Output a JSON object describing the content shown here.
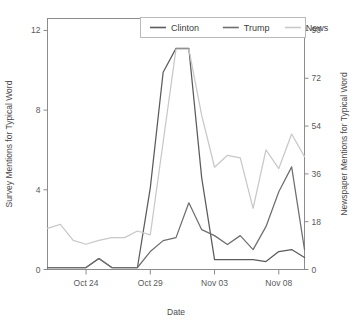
{
  "figure": {
    "title": "",
    "background": "#ffffff"
  },
  "legend": {
    "position": "top-right-inside",
    "border_color": "#b9b9b9",
    "items": [
      {
        "label": "Clinton",
        "color": "#5b5b5b"
      },
      {
        "label": "Trump",
        "color": "#6e6e6e"
      },
      {
        "label": "News",
        "color": "#c8c8c8"
      }
    ]
  },
  "chart_data": {
    "type": "line",
    "title": "",
    "xlabel": "Date",
    "ylabel": "Survey Mentions for Typical Word",
    "y2label": "Newspaper Mentions for Typical Word",
    "grid": false,
    "legend_position": "top right",
    "x": [
      "Oct 21",
      "Oct 22",
      "Oct 23",
      "Oct 24",
      "Oct 25",
      "Oct 26",
      "Oct 27",
      "Oct 28",
      "Oct 29",
      "Oct 30",
      "Oct 31",
      "Nov 01",
      "Nov 02",
      "Nov 03",
      "Nov 04",
      "Nov 05",
      "Nov 06",
      "Nov 07",
      "Nov 08",
      "Nov 09",
      "Nov 10"
    ],
    "xtick_labels": [
      "Oct 24",
      "Oct 29",
      "Nov 03",
      "Nov 08"
    ],
    "xtick_positions": [
      "Oct 24",
      "Oct 29",
      "Nov 03",
      "Nov 08"
    ],
    "ylim": [
      0,
      12.6
    ],
    "yticks": [
      0,
      4,
      8,
      12
    ],
    "y2lim": [
      0,
      94.5
    ],
    "y2ticks": [
      0,
      18,
      36,
      54,
      72,
      90
    ],
    "series": [
      {
        "name": "Clinton",
        "axis": "left",
        "color": "#5b5b5b",
        "values": [
          0.1,
          0.1,
          0.1,
          0.1,
          0.55,
          0.1,
          0.1,
          0.1,
          4.1,
          9.9,
          11.1,
          11.1,
          4.6,
          0.5,
          0.5,
          0.5,
          0.5,
          0.4,
          0.9,
          1.0,
          0.6
        ]
      },
      {
        "name": "Trump",
        "axis": "left",
        "color": "#6e6e6e",
        "values": [
          0.1,
          0.1,
          0.1,
          0.1,
          0.55,
          0.1,
          0.1,
          0.1,
          0.9,
          1.45,
          1.6,
          3.35,
          2.0,
          1.7,
          1.25,
          1.7,
          1.0,
          2.15,
          3.9,
          5.15,
          1.0
        ]
      },
      {
        "name": "News",
        "axis": "right",
        "color": "#c8c8c8",
        "values": [
          15.5,
          17.0,
          11.0,
          9.5,
          11.0,
          12.0,
          12.0,
          14.5,
          13.0,
          48.0,
          83.0,
          83.0,
          58.0,
          38.5,
          43.0,
          42.0,
          23.0,
          45.0,
          38.0,
          51.0,
          42.5
        ]
      }
    ]
  },
  "axes": {
    "left": {
      "title": "Survey Mentions for Typical Word",
      "tick_labels": [
        "0",
        "4",
        "8",
        "12"
      ]
    },
    "right": {
      "title": "Newspaper Mentions for Typical Word",
      "tick_labels": [
        "0",
        "18",
        "36",
        "54",
        "72",
        "90"
      ]
    },
    "bottom": {
      "title": "Date",
      "tick_labels": [
        "Oct 24",
        "Oct 29",
        "Nov 03",
        "Nov 08"
      ]
    },
    "frame_color": "#888888"
  }
}
